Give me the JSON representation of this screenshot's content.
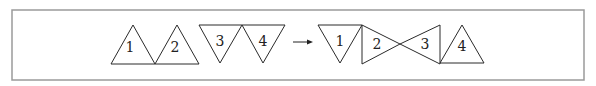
{
  "diagram": {
    "title": "",
    "frame": {
      "x": 12,
      "y": 10,
      "width": 572,
      "height": 70,
      "stroke": "#9a9a9a"
    },
    "before": {
      "triangles": [
        {
          "label": "1",
          "points": "111,64 133,25 155,64",
          "label_pos": [
            130,
            47
          ],
          "orientation": "up"
        },
        {
          "label": "2",
          "points": "155,64 177,25 199,64",
          "label_pos": [
            175,
            47
          ],
          "orientation": "up"
        },
        {
          "label": "3",
          "points": "199,25 242,25 220,63",
          "label_pos": [
            220,
            41
          ],
          "orientation": "down"
        },
        {
          "label": "4",
          "points": "242,25 285,25 263,63",
          "label_pos": [
            263,
            41
          ],
          "orientation": "down"
        }
      ]
    },
    "arrow": {
      "x1": 293,
      "y1": 42,
      "x2": 313,
      "y2": 42,
      "label": "→"
    },
    "after": {
      "triangles": [
        {
          "label": "1",
          "points": "318,25 362,25 340,63",
          "label_pos": [
            340,
            41
          ],
          "orientation": "down"
        },
        {
          "label": "2",
          "points": "362,25 400,44 362,64",
          "label_pos": [
            377,
            44
          ],
          "orientation": "right"
        },
        {
          "label": "3",
          "points": "440,25 400,44 440,64",
          "label_pos": [
            425,
            44
          ],
          "orientation": "left"
        },
        {
          "label": "4",
          "points": "440,63 462,25 484,63",
          "label_pos": [
            462,
            46
          ],
          "orientation": "up"
        }
      ]
    }
  }
}
